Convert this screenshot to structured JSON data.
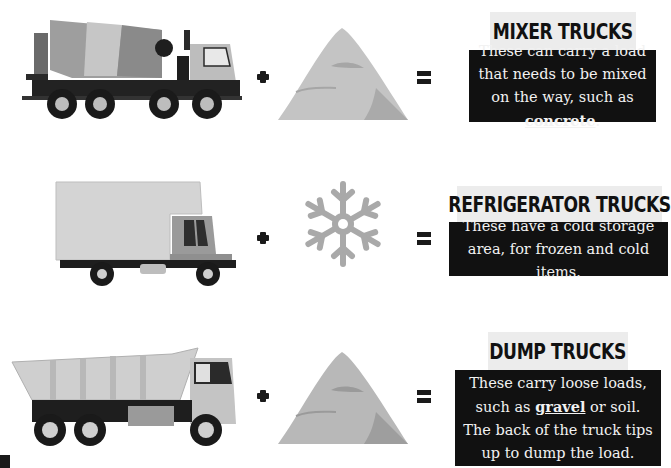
{
  "rows": [
    {
      "id": "mixer",
      "truck_icon": "mixer-truck-icon",
      "load_icon": "sand-pile-icon",
      "operator_plus": "+",
      "operator_equals": "=",
      "title": "MIXER TRUCKS",
      "description_before": "These can carry a load that needs to be mixed on the way, such as ",
      "description_keyword": "concrete",
      "description_after": "."
    },
    {
      "id": "refrigerator",
      "truck_icon": "refrigerator-truck-icon",
      "load_icon": "snowflake-icon",
      "operator_plus": "+",
      "operator_equals": "=",
      "title": "REFRIGERATOR TRUCKS",
      "description_before": "These have a cold storage area, for frozen and cold items.",
      "description_keyword": "",
      "description_after": ""
    },
    {
      "id": "dump",
      "truck_icon": "dump-truck-icon",
      "load_icon": "gravel-pile-icon",
      "operator_plus": "+",
      "operator_equals": "=",
      "title": "DUMP TRUCKS",
      "description_before": "These carry loose loads, such as ",
      "description_keyword": "gravel",
      "description_after": " or soil. The back of the truck tips up to dump the load."
    }
  ],
  "colors": {
    "title_bg": "#ececec",
    "text_bg": "#111111",
    "text_fg": "#f2f2f2",
    "icon_gray": "#a9a9a9",
    "pile_gray": "#c4c4c4"
  }
}
